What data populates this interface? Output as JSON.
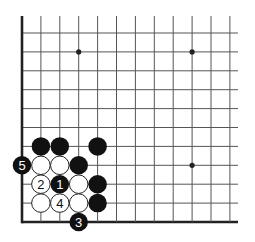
{
  "diagram": {
    "type": "go-board-corner",
    "corner": "bottom-left",
    "grid": {
      "columns": 12,
      "rows": 11,
      "origin_x": 22,
      "origin_y": 33,
      "spacing": 18.9,
      "top_extend": 16,
      "right_extend": 238,
      "line_color": "#555555",
      "edge_color": "#222222"
    },
    "star_points": [
      {
        "col": 3,
        "row": 1
      },
      {
        "col": 9,
        "row": 1
      },
      {
        "col": 9,
        "row": 7
      }
    ],
    "stones": [
      {
        "color": "black",
        "col": 1,
        "row": 6,
        "label": ""
      },
      {
        "color": "black",
        "col": 2,
        "row": 6,
        "label": ""
      },
      {
        "color": "black",
        "col": 4,
        "row": 6,
        "label": ""
      },
      {
        "color": "black",
        "col": 0,
        "row": 7,
        "label": "5"
      },
      {
        "color": "white",
        "col": 1,
        "row": 7,
        "label": ""
      },
      {
        "color": "white",
        "col": 2,
        "row": 7,
        "label": ""
      },
      {
        "color": "black",
        "col": 3,
        "row": 7,
        "label": ""
      },
      {
        "color": "white",
        "col": 1,
        "row": 8,
        "label": "2"
      },
      {
        "color": "black",
        "col": 2,
        "row": 8,
        "label": "1"
      },
      {
        "color": "white",
        "col": 3,
        "row": 8,
        "label": ""
      },
      {
        "color": "black",
        "col": 4,
        "row": 8,
        "label": ""
      },
      {
        "color": "white",
        "col": 1,
        "row": 9,
        "label": ""
      },
      {
        "color": "white",
        "col": 2,
        "row": 9,
        "label": "4"
      },
      {
        "color": "white",
        "col": 3,
        "row": 9,
        "label": ""
      },
      {
        "color": "black",
        "col": 4,
        "row": 9,
        "label": ""
      },
      {
        "color": "black",
        "col": 3,
        "row": 10,
        "label": "3"
      }
    ],
    "colors": {
      "black_stone": "#111111",
      "white_stone": "#ffffff",
      "white_stone_outline": "#222222",
      "label_on_black": "#ffffff",
      "label_on_white": "#111111"
    }
  }
}
